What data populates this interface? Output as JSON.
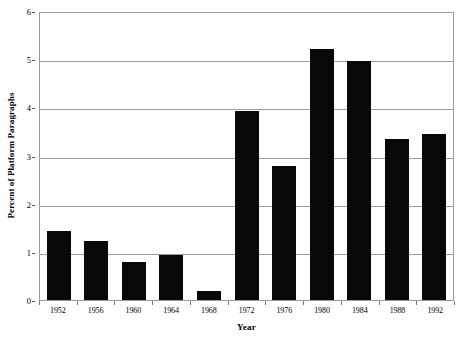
{
  "chart_data": {
    "type": "bar",
    "title": "",
    "subtitle": "",
    "xlabel": "Year",
    "ylabel": "Percent of Platform Paragraphs",
    "categories": [
      "1952",
      "1956",
      "1960",
      "1964",
      "1968",
      "1972",
      "1976",
      "1980",
      "1984",
      "1988",
      "1992"
    ],
    "values": [
      1.43,
      1.22,
      0.78,
      0.93,
      0.18,
      3.93,
      2.78,
      5.22,
      4.97,
      3.35,
      3.45
    ],
    "ylim": [
      0,
      6
    ],
    "ytick_labels": [
      "0",
      "1",
      "2",
      "3",
      "4",
      "5",
      "6"
    ],
    "ytick_values": [
      0,
      1,
      2,
      3,
      4,
      5,
      6
    ],
    "grid": "horizontal",
    "legend": "none",
    "bar_color": "#080808",
    "grid_color": "#9a9a9a",
    "background_color": "#ffffff",
    "annotations": []
  }
}
